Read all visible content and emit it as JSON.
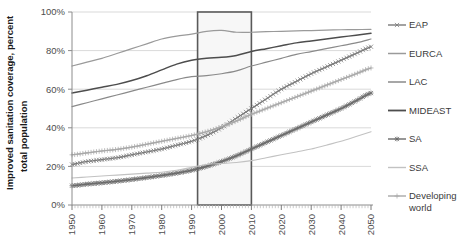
{
  "chart_data": {
    "type": "line",
    "title": "",
    "xlabel": "",
    "ylabel": "Improved sanitation coverage, percent total population",
    "ylabel_line1": "Improved sanitation coverage, percent",
    "ylabel_line2": "total population",
    "xlim": [
      1950,
      2050
    ],
    "ylim": [
      0,
      100
    ],
    "grid": true,
    "legend_position": "right",
    "x_ticks": [
      "1950",
      "1960",
      "1970",
      "1980",
      "1990",
      "2000",
      "2010",
      "2020",
      "2030",
      "2040",
      "2050"
    ],
    "x_tick_values": [
      1950,
      1960,
      1970,
      1980,
      1990,
      2000,
      2010,
      2020,
      2030,
      2040,
      2050
    ],
    "y_ticks": [
      "0%",
      "20%",
      "40%",
      "60%",
      "80%",
      "100%"
    ],
    "y_tick_values": [
      0,
      20,
      40,
      60,
      80,
      100
    ],
    "highlight_box": {
      "x_start": 1992,
      "x_end": 2010,
      "y_start": 0,
      "y_end": 100,
      "stroke": "#595959",
      "fill": "#f7f7f7"
    },
    "x": [
      1950,
      1955,
      1960,
      1965,
      1970,
      1975,
      1980,
      1985,
      1990,
      1995,
      2000,
      2005,
      2010,
      2015,
      2020,
      2025,
      2030,
      2035,
      2040,
      2045,
      2050
    ],
    "series": [
      {
        "name": "EAP",
        "color": "#7a7a7a",
        "marker": "cross",
        "width": 1.1,
        "values": [
          21,
          22.5,
          23.5,
          24.5,
          26,
          27.5,
          29,
          31,
          33,
          36,
          40,
          45,
          50,
          55,
          60,
          64,
          68,
          71.5,
          75,
          78.5,
          82
        ]
      },
      {
        "name": "EURCA",
        "color": "#9a9a9a",
        "marker": "none",
        "width": 1.2,
        "values": [
          72,
          74,
          76,
          78.5,
          81,
          83.5,
          86,
          87.5,
          88.5,
          90,
          90.5,
          89.5,
          89.5,
          89.8,
          90,
          90.2,
          90.4,
          90.6,
          90.8,
          90.9,
          91
        ]
      },
      {
        "name": "LAC",
        "color": "#8a8a8a",
        "marker": "none",
        "width": 1.2,
        "values": [
          51,
          53,
          55,
          57,
          59,
          61,
          63,
          65,
          66.5,
          67,
          68,
          69.5,
          72,
          74,
          76,
          78,
          79.5,
          81,
          82.5,
          84,
          86
        ]
      },
      {
        "name": "MIDEAST",
        "color": "#4d4d4d",
        "marker": "none",
        "width": 1.5,
        "values": [
          58,
          59.5,
          61,
          62.5,
          64.5,
          67,
          70,
          73,
          75,
          76,
          76.5,
          77.5,
          79.5,
          81,
          82.5,
          84,
          85,
          86,
          87,
          88,
          89
        ]
      },
      {
        "name": "SA",
        "color": "#6b6b6b",
        "marker": "asterisk",
        "width": 1.1,
        "values": [
          10,
          10.8,
          11.5,
          12.3,
          13.2,
          14.2,
          15.3,
          16.5,
          18,
          20,
          22.5,
          25.5,
          29,
          32.5,
          36,
          39.5,
          43,
          46.5,
          50,
          54,
          58
        ]
      },
      {
        "name": "SSA",
        "color": "#c2c2c2",
        "marker": "none",
        "width": 1.1,
        "values": [
          14,
          14.5,
          15,
          15.5,
          16,
          16.5,
          17,
          18,
          19.5,
          21,
          21.5,
          22,
          23,
          24.5,
          26,
          27.5,
          29,
          31,
          33,
          35.5,
          38
        ]
      },
      {
        "name": "Developing world",
        "color": "#a8a8a8",
        "marker": "plus",
        "width": 1.1,
        "values": [
          26,
          27,
          28,
          28.8,
          30,
          31.5,
          33,
          34.5,
          36,
          38,
          40.5,
          43.5,
          47,
          50,
          53,
          56,
          59,
          62,
          65,
          68,
          71
        ]
      }
    ]
  },
  "legend": {
    "items": [
      {
        "label": "EAP"
      },
      {
        "label": "EURCA"
      },
      {
        "label": "LAC"
      },
      {
        "label": "MIDEAST"
      },
      {
        "label": "SA"
      },
      {
        "label": "SSA"
      },
      {
        "label": "Developing world"
      }
    ]
  }
}
